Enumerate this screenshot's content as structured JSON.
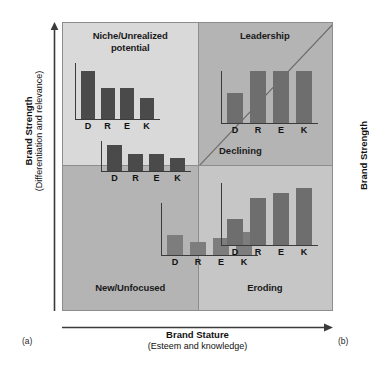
{
  "figure": {
    "markers": {
      "left": "(a)",
      "right": "(b)"
    }
  },
  "axes": {
    "left": {
      "title": "Brand Strength",
      "subtitle": "(Differentiation and relevance)"
    },
    "right": {
      "title": "Brand Strength"
    },
    "bottom": {
      "title": "Brand Stature",
      "subtitle": "(Esteem and knowledge)"
    }
  },
  "colors": {
    "quadrant_niche_bg": "#d9d9d9",
    "quadrant_leadership_bg": "#b4b4b4",
    "quadrant_new_bg": "#b4b4b4",
    "quadrant_eroding_bg": "#c6c6c6",
    "bar_dark": "#4a4a4a",
    "bar_mid": "#6e6e6e",
    "bar_light": "#7d7d7d",
    "frame_border": "#8d8d8d",
    "axis_line": "#3b3b3b",
    "text": "#111111"
  },
  "quadrants": [
    {
      "id": "niche",
      "label": "Niche/Unrealized\npotential",
      "label_line1": "Niche/Unrealized",
      "label_line2": "potential"
    },
    {
      "id": "leadership",
      "label": "Leadership"
    },
    {
      "id": "new",
      "label": "New/Unfocused"
    },
    {
      "id": "eroding",
      "label": "Eroding"
    }
  ],
  "floating_labels": [
    {
      "id": "declining",
      "text": "Declining"
    }
  ],
  "chart_data": [
    {
      "type": "bar",
      "id": "niche-chart",
      "title": "Niche/Unrealized potential",
      "categories": [
        "D",
        "R",
        "E",
        "K"
      ],
      "values": [
        85,
        55,
        55,
        38
      ],
      "ylim": [
        0,
        100
      ],
      "xlabel": "",
      "ylabel": "",
      "grid": false,
      "bar_color": "#4a4a4a",
      "note": "Descending: high differentiation, lower esteem and knowledge"
    },
    {
      "type": "bar",
      "id": "leadership-chart",
      "title": "Leadership",
      "categories": [
        "D",
        "R",
        "E",
        "K"
      ],
      "values": [
        58,
        100,
        100,
        100
      ],
      "ylim": [
        0,
        100
      ],
      "xlabel": "",
      "ylabel": "",
      "grid": false,
      "bar_color": "#6e6e6e",
      "note": "D lower, R E K equal and high"
    },
    {
      "type": "bar",
      "id": "declining-chart",
      "title": "Declining",
      "categories": [
        "D",
        "R",
        "E",
        "K"
      ],
      "values": [
        88,
        57,
        57,
        42
      ],
      "ylim": [
        0,
        100
      ],
      "xlabel": "",
      "ylabel": "",
      "grid": false,
      "bar_color": "#4a4a4a",
      "note": "Descending pattern straddling the quadrant boundary"
    },
    {
      "type": "bar",
      "id": "new-chart",
      "title": "New/Unfocused",
      "categories": [
        "D",
        "R",
        "E",
        "K"
      ],
      "values": [
        38,
        25,
        32,
        45
      ],
      "ylim": [
        0,
        100
      ],
      "xlabel": "",
      "ylabel": "",
      "grid": false,
      "bar_color": "#7d7d7d",
      "note": "All low and roughly flat"
    },
    {
      "type": "bar",
      "id": "eroding-chart",
      "title": "Eroding",
      "categories": [
        "D",
        "R",
        "E",
        "K"
      ],
      "values": [
        42,
        76,
        84,
        92
      ],
      "ylim": [
        0,
        100
      ],
      "xlabel": "",
      "ylabel": "",
      "grid": false,
      "bar_color": "#6e6e6e",
      "note": "Ascending: low differentiation, high knowledge"
    }
  ]
}
